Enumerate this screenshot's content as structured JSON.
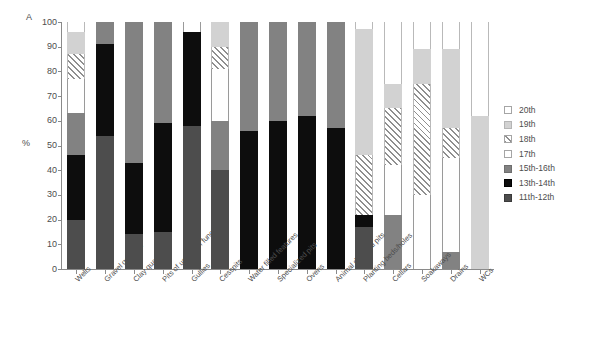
{
  "panel": {
    "letter": "A"
  },
  "axes": {
    "ylabel": "%",
    "yticks": [
      "100",
      "90",
      "80",
      "70",
      "60",
      "50",
      "40",
      "30",
      "20",
      "10",
      "0"
    ],
    "ymin": 0,
    "ymax": 100
  },
  "legend": {
    "position": "right",
    "items": [
      {
        "label": "20th",
        "key": "20th",
        "fill": "white",
        "color": "#ffffff"
      },
      {
        "label": "19th",
        "key": "19th",
        "fill": "light-gray",
        "color": "#d2d2d2"
      },
      {
        "label": "18th",
        "key": "18th",
        "fill": "hatched",
        "color": "#8f8f8f"
      },
      {
        "label": "17th",
        "key": "17th",
        "fill": "white",
        "color": "#ffffff"
      },
      {
        "label": "15th-16th",
        "key": "15th-16th",
        "fill": "medium-gray",
        "color": "#828282"
      },
      {
        "label": "13th-14th",
        "key": "13th-14th",
        "fill": "black",
        "color": "#0d0d0d"
      },
      {
        "label": "11th-12th",
        "key": "11th-12th",
        "fill": "dark-gray",
        "color": "#4d4d4d"
      }
    ]
  },
  "chart_data": {
    "type": "bar",
    "subtype": "stacked-percentage",
    "title": "",
    "subtitle": "",
    "xlabel": "",
    "ylabel": "%",
    "ylim": [
      0,
      100
    ],
    "grid": false,
    "legend_position": "right",
    "categories": [
      "Wells",
      "Gravel quarries",
      "Clay quarries",
      "Pits of unknown function",
      "Gullies",
      "Cesspits",
      "Water filled features",
      "Specialized pits",
      "Ovens",
      "Animal disposal pits",
      "Planting beds/holes",
      "Cellars",
      "Soakaways",
      "Drains",
      "WCs"
    ],
    "series": [
      {
        "name": "11th-12th",
        "values": [
          20,
          54,
          14,
          15,
          58,
          40,
          0,
          0,
          0,
          0,
          17,
          0,
          0,
          0,
          0
        ]
      },
      {
        "name": "13th-14th",
        "values": [
          26,
          37,
          29,
          44,
          38,
          0,
          56,
          60,
          62,
          57,
          5,
          0,
          0,
          0,
          0
        ]
      },
      {
        "name": "15th-16th",
        "values": [
          17,
          9,
          57,
          41,
          0,
          20,
          44,
          40,
          38,
          43,
          0,
          22,
          0,
          7,
          0
        ]
      },
      {
        "name": "17th",
        "values": [
          14,
          0,
          0,
          0,
          4,
          21,
          0,
          0,
          0,
          0,
          0,
          20,
          30,
          38,
          0
        ]
      },
      {
        "name": "18th",
        "values": [
          10,
          0,
          0,
          0,
          0,
          9,
          0,
          0,
          0,
          0,
          24,
          23,
          45,
          12,
          0
        ]
      },
      {
        "name": "19th",
        "values": [
          9,
          0,
          0,
          0,
          0,
          10,
          0,
          0,
          0,
          0,
          51,
          10,
          14,
          32,
          62
        ]
      },
      {
        "name": "20th",
        "values": [
          4,
          0,
          0,
          0,
          0,
          0,
          0,
          0,
          0,
          0,
          3,
          25,
          11,
          11,
          38
        ]
      }
    ]
  }
}
